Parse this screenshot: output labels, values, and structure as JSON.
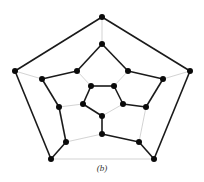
{
  "caption": "(b)",
  "colors": {
    "cycle_edge": "#1a1a1a",
    "other_edge": "#c8c8c8",
    "vertex": "#0a0a0a"
  },
  "graph": {
    "type": "dodecahedron",
    "vertices": [
      "O0",
      "O1",
      "O2",
      "O3",
      "O4",
      "M0",
      "M1",
      "M2",
      "M3",
      "M4",
      "M5",
      "M6",
      "M7",
      "M8",
      "M9",
      "I0",
      "I1",
      "I2",
      "I3",
      "I4"
    ],
    "edges": [
      {
        "from": "O0",
        "to": "O1",
        "in_cycle": true
      },
      {
        "from": "O1",
        "to": "O2",
        "in_cycle": true
      },
      {
        "from": "O2",
        "to": "O3",
        "in_cycle": false
      },
      {
        "from": "O3",
        "to": "O4",
        "in_cycle": true
      },
      {
        "from": "O4",
        "to": "O0",
        "in_cycle": true
      },
      {
        "from": "O0",
        "to": "M0",
        "in_cycle": false
      },
      {
        "from": "O1",
        "to": "M2",
        "in_cycle": false
      },
      {
        "from": "O2",
        "to": "M4",
        "in_cycle": true
      },
      {
        "from": "O3",
        "to": "M6",
        "in_cycle": true
      },
      {
        "from": "O4",
        "to": "M8",
        "in_cycle": false
      },
      {
        "from": "M0",
        "to": "M1",
        "in_cycle": true
      },
      {
        "from": "M1",
        "to": "M2",
        "in_cycle": true
      },
      {
        "from": "M2",
        "to": "M3",
        "in_cycle": true
      },
      {
        "from": "M3",
        "to": "M4",
        "in_cycle": false
      },
      {
        "from": "M4",
        "to": "M5",
        "in_cycle": true
      },
      {
        "from": "M5",
        "to": "M6",
        "in_cycle": false
      },
      {
        "from": "M6",
        "to": "M7",
        "in_cycle": true
      },
      {
        "from": "M7",
        "to": "M8",
        "in_cycle": true
      },
      {
        "from": "M8",
        "to": "M9",
        "in_cycle": true
      },
      {
        "from": "M9",
        "to": "M0",
        "in_cycle": true
      },
      {
        "from": "M1",
        "to": "I1",
        "in_cycle": false
      },
      {
        "from": "M3",
        "to": "I2",
        "in_cycle": true
      },
      {
        "from": "M5",
        "to": "I3",
        "in_cycle": true
      },
      {
        "from": "M7",
        "to": "I4",
        "in_cycle": false
      },
      {
        "from": "M9",
        "to": "I0",
        "in_cycle": false
      },
      {
        "from": "I0",
        "to": "I1",
        "in_cycle": true
      },
      {
        "from": "I1",
        "to": "I2",
        "in_cycle": true
      },
      {
        "from": "I2",
        "to": "I3",
        "in_cycle": false
      },
      {
        "from": "I3",
        "to": "I4",
        "in_cycle": true
      },
      {
        "from": "I4",
        "to": "I0",
        "in_cycle": true
      }
    ]
  }
}
